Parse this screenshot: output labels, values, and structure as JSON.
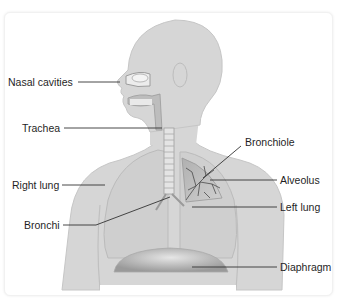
{
  "diagram": {
    "colors": {
      "body": "#d6d6d6",
      "body_outline": "#c4c4c4",
      "lung": "#cacaca",
      "lung_detail": "#8a8a8a",
      "bronchiole_tree": "#4a4a4a",
      "leader_line": "#333333",
      "text": "#1f1f1f"
    },
    "labels": [
      {
        "id": "nasal-cavities",
        "text": "Nasal cavities",
        "side": "left"
      },
      {
        "id": "trachea",
        "text": "Trachea",
        "side": "left"
      },
      {
        "id": "right-lung",
        "text": "Right lung",
        "side": "left"
      },
      {
        "id": "bronchi",
        "text": "Bronchi",
        "side": "left"
      },
      {
        "id": "bronchiole",
        "text": "Bronchiole",
        "side": "right"
      },
      {
        "id": "alveolus",
        "text": "Alveolus",
        "side": "right"
      },
      {
        "id": "left-lung",
        "text": "Left lung",
        "side": "right"
      },
      {
        "id": "diaphragm",
        "text": "Diaphragm",
        "side": "right"
      }
    ]
  }
}
